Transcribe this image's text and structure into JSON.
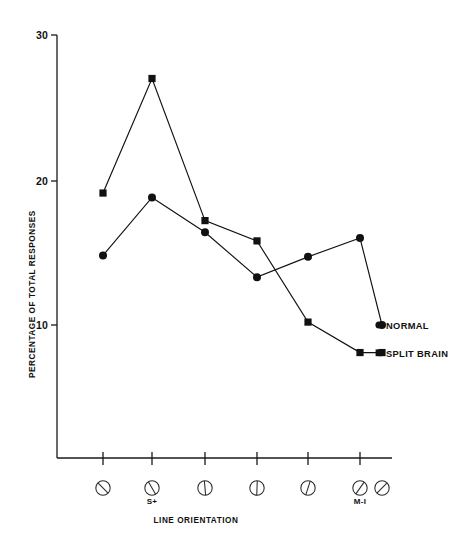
{
  "chart_data": {
    "type": "line",
    "title": "",
    "subtitle": "",
    "xlabel": "LINE ORIENTATION",
    "ylabel": "PERCENTAGE OF TOTAL RESPONSES",
    "ylim": [
      0,
      30
    ],
    "yticks": [
      10,
      20,
      30
    ],
    "ytick_labels": [
      "10",
      "20",
      "30"
    ],
    "grid": false,
    "legend_position": "right-inline",
    "categories": [
      "orientation-1",
      "orientation-2",
      "orientation-3",
      "orientation-4",
      "orientation-5",
      "orientation-6",
      "orientation-7"
    ],
    "category_icons": [
      {
        "name": "circle-slash-135-icon",
        "angle_deg": 135,
        "sublabel": ""
      },
      {
        "name": "circle-slash-120-icon",
        "angle_deg": 120,
        "sublabel": "S+"
      },
      {
        "name": "circle-slash-95-icon",
        "angle_deg": 95,
        "sublabel": ""
      },
      {
        "name": "circle-slash-90-icon",
        "angle_deg": 88,
        "sublabel": ""
      },
      {
        "name": "circle-slash-75-icon",
        "angle_deg": 72,
        "sublabel": ""
      },
      {
        "name": "circle-slash-55-icon",
        "angle_deg": 55,
        "sublabel": "M-I"
      },
      {
        "name": "circle-slash-45-icon",
        "angle_deg": 45,
        "sublabel": ""
      }
    ],
    "series": [
      {
        "name": "NORMAL",
        "marker": "circle",
        "values": [
          14.8,
          18.8,
          16.4,
          13.3,
          14.7,
          16.0,
          10.0
        ]
      },
      {
        "name": "SPLIT BRAIN",
        "marker": "square",
        "values": [
          19.1,
          27.0,
          17.2,
          15.8,
          10.2,
          8.1,
          8.1
        ]
      }
    ],
    "colors": {
      "ink": "#111111",
      "axis": "#1a1a1a",
      "background": "#ffffff"
    }
  },
  "axis": {
    "y_label": "PERCENTAGE OF TOTAL RESPONSES",
    "x_label": "LINE ORIENTATION",
    "y_tick_30": "30",
    "y_tick_20": "20",
    "y_tick_10": "10"
  },
  "x_sublabels": {
    "s_plus": "S+",
    "m_i": "M-I"
  },
  "legend": {
    "normal": "NORMAL",
    "split_brain": "SPLIT BRAIN"
  }
}
